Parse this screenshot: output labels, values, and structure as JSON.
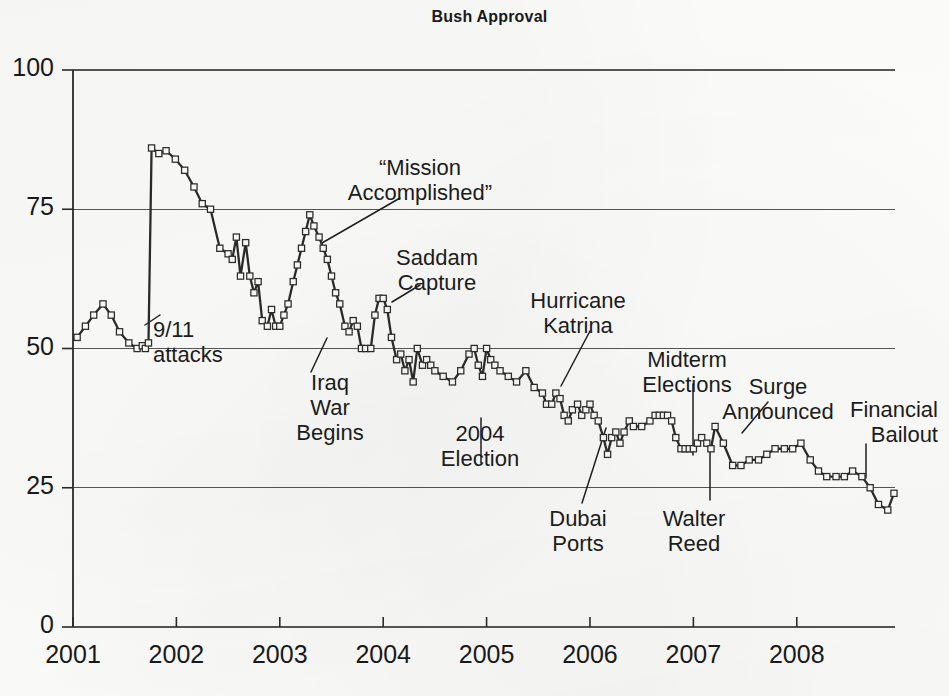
{
  "chart_data": {
    "type": "line",
    "title": "Bush Approval",
    "xlabel": "",
    "ylabel": "",
    "grid": true,
    "legend": "none",
    "ylim": [
      0,
      100
    ],
    "ytick_labels": [
      "100",
      "75",
      "50",
      "25",
      "0"
    ],
    "ytick_values": [
      100,
      75,
      50,
      25,
      0
    ],
    "xlim": [
      2001.0,
      2008.95
    ],
    "xtick_labels": [
      "2001",
      "2002",
      "2003",
      "2004",
      "2005",
      "2006",
      "2007",
      "2008"
    ],
    "xtick_values": [
      2001,
      2002,
      2003,
      2004,
      2005,
      2006,
      2007,
      2008
    ],
    "series": [
      {
        "name": "Bush Approval",
        "x": [
          2001.04,
          2001.12,
          2001.2,
          2001.29,
          2001.37,
          2001.45,
          2001.54,
          2001.62,
          2001.67,
          2001.7,
          2001.73,
          2001.76,
          2001.83,
          2001.9,
          2001.99,
          2002.08,
          2002.17,
          2002.25,
          2002.33,
          2002.42,
          2002.5,
          2002.54,
          2002.58,
          2002.62,
          2002.67,
          2002.71,
          2002.75,
          2002.79,
          2002.83,
          2002.88,
          2002.92,
          2002.96,
          2003.0,
          2003.04,
          2003.08,
          2003.13,
          2003.17,
          2003.21,
          2003.25,
          2003.29,
          2003.33,
          2003.38,
          2003.42,
          2003.46,
          2003.5,
          2003.54,
          2003.58,
          2003.63,
          2003.67,
          2003.71,
          2003.75,
          2003.79,
          2003.83,
          2003.88,
          2003.92,
          2003.96,
          2004.0,
          2004.04,
          2004.08,
          2004.13,
          2004.17,
          2004.21,
          2004.25,
          2004.29,
          2004.33,
          2004.38,
          2004.42,
          2004.46,
          2004.5,
          2004.58,
          2004.67,
          2004.75,
          2004.83,
          2004.88,
          2004.92,
          2004.96,
          2005.0,
          2005.04,
          2005.08,
          2005.13,
          2005.21,
          2005.29,
          2005.38,
          2005.46,
          2005.54,
          2005.58,
          2005.63,
          2005.67,
          2005.71,
          2005.75,
          2005.79,
          2005.83,
          2005.88,
          2005.92,
          2005.96,
          2006.0,
          2006.04,
          2006.08,
          2006.13,
          2006.17,
          2006.21,
          2006.25,
          2006.29,
          2006.33,
          2006.38,
          2006.42,
          2006.5,
          2006.58,
          2006.63,
          2006.67,
          2006.71,
          2006.75,
          2006.79,
          2006.83,
          2006.88,
          2006.92,
          2006.96,
          2007.0,
          2007.04,
          2007.08,
          2007.13,
          2007.17,
          2007.21,
          2007.29,
          2007.38,
          2007.46,
          2007.54,
          2007.63,
          2007.71,
          2007.79,
          2007.88,
          2007.96,
          2008.04,
          2008.13,
          2008.21,
          2008.29,
          2008.38,
          2008.46,
          2008.54,
          2008.63,
          2008.71,
          2008.79,
          2008.88,
          2008.94
        ],
        "values": [
          52,
          54,
          56,
          58,
          56,
          53,
          51,
          50,
          50.5,
          50,
          51,
          86,
          85,
          85.5,
          84,
          82,
          79,
          76,
          75,
          68,
          67,
          66,
          70,
          63,
          69,
          63,
          60,
          62,
          55,
          54,
          57,
          54,
          54,
          56,
          58,
          62,
          65,
          68,
          71,
          74,
          72,
          70,
          68,
          66,
          63,
          60,
          58,
          54,
          53,
          55,
          54,
          50,
          50,
          50,
          56,
          59,
          59,
          57,
          52,
          48,
          49,
          46,
          48,
          44,
          50,
          47,
          48,
          47,
          46,
          45,
          44,
          46,
          49,
          50,
          47,
          45,
          50,
          48,
          47,
          46,
          45,
          44,
          46,
          43,
          42,
          40,
          40,
          42,
          41,
          38,
          37,
          39,
          40,
          38,
          39,
          40,
          38,
          37,
          34,
          31,
          34,
          35,
          33,
          35,
          37,
          36,
          36,
          37,
          38,
          38,
          38,
          38,
          37,
          34,
          32,
          32,
          32,
          32,
          33,
          34,
          33,
          32,
          36,
          33,
          29,
          29,
          30,
          30,
          31,
          32,
          32,
          32,
          33,
          30,
          28,
          27,
          27,
          27,
          28,
          27,
          25,
          22,
          21,
          24
        ],
        "marker": "square-open",
        "color": "#2b2b2b"
      }
    ],
    "annotations": [
      {
        "id": "nine-eleven",
        "label": "9/11\nattacks",
        "align": "left",
        "text_x": 153,
        "text_y": 317,
        "line": [
          145,
          325,
          160,
          315
        ]
      },
      {
        "id": "mission-accomplished",
        "label": "“Mission\nAccomplished”",
        "align": "center",
        "text_x": 420,
        "text_y": 155,
        "line": [
          322,
          243,
          400,
          198
        ]
      },
      {
        "id": "iraq-war-begins",
        "label": "Iraq\nWar\nBegins",
        "align": "center",
        "text_x": 330,
        "text_y": 370,
        "line": [
          311,
          372,
          327,
          338
        ]
      },
      {
        "id": "saddam-capture",
        "label": "Saddam\nCapture",
        "align": "center",
        "text_x": 437,
        "text_y": 245,
        "line": [
          392,
          302,
          420,
          285
        ]
      },
      {
        "id": "election-2004",
        "label": "2004\nElection",
        "align": "center",
        "text_x": 480,
        "text_y": 421,
        "line": [
          481,
          418,
          481,
          463
        ]
      },
      {
        "id": "hurricane-katrina",
        "label": "Hurricane\nKatrina",
        "align": "center",
        "text_x": 578,
        "text_y": 288,
        "line": [
          561,
          386,
          590,
          331
        ]
      },
      {
        "id": "dubai-ports",
        "label": "Dubai\nPorts",
        "align": "center",
        "text_x": 578,
        "text_y": 506,
        "line": [
          606,
          428,
          582,
          503
        ]
      },
      {
        "id": "midterm-elections",
        "label": "Midterm\nElections",
        "align": "center",
        "text_x": 687,
        "text_y": 347,
        "line": [
          693,
          384,
          693,
          455
        ]
      },
      {
        "id": "walter-reed",
        "label": "Walter\nReed",
        "align": "center",
        "text_x": 694,
        "text_y": 506,
        "line": [
          710,
          450,
          710,
          500
        ]
      },
      {
        "id": "surge-announced",
        "label": "Surge\nAnnounced",
        "align": "center",
        "text_x": 778,
        "text_y": 374,
        "line": [
          742,
          433,
          768,
          402
        ]
      },
      {
        "id": "financial-bailout",
        "label": "Financial\nBailout",
        "align": "right",
        "text_x": 938,
        "text_y": 397,
        "line": [
          866,
          444,
          866,
          478
        ]
      }
    ]
  },
  "axis_geometry": {
    "plot_left": 73,
    "plot_right": 895,
    "y_top_px": 70,
    "y_bottom_px": 627,
    "year_width_px": 104
  }
}
